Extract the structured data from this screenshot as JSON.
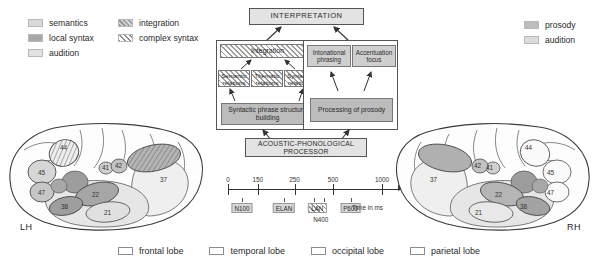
{
  "legend_left": {
    "items": [
      {
        "label": "semantics",
        "swatch": "sw-semantics"
      },
      {
        "label": "local syntax",
        "swatch": "sw-localsyntax"
      },
      {
        "label": "audition",
        "swatch": "sw-audition"
      }
    ]
  },
  "legend_middle": {
    "items": [
      {
        "label": "integration",
        "swatch": "sw-integration"
      },
      {
        "label": "complex syntax",
        "swatch": "sw-complex"
      }
    ]
  },
  "legend_right": {
    "items": [
      {
        "label": "prosody",
        "swatch": "sw-prosody"
      },
      {
        "label": "audition",
        "swatch": "sw-audition2"
      }
    ]
  },
  "legend_lobes": {
    "items": [
      {
        "label": "frontal lobe"
      },
      {
        "label": "temporal lobe"
      },
      {
        "label": "occipital lobe"
      },
      {
        "label": "parietal lobe"
      }
    ]
  },
  "flowchart": {
    "interpretation": "INTERPRETATION",
    "acoustic_processor": "ACOUSTIC-PHONOLOGICAL PROCESSOR",
    "syntax_panel": {
      "integration": "Integration",
      "semantic_relations": "Semantic relations",
      "thematic_relations": "Thematic relations",
      "syntactic_relations": "Syntactic relations",
      "phrase_structure": "Syntactic phrase structure building"
    },
    "prosody_panel": {
      "intonational_phrasing": "Intonational phrasing",
      "accentuation_focus": "Accentuation focus",
      "processing_of_prosody": "Processing of prosody"
    }
  },
  "timeline": {
    "unit_label": "Time in ms",
    "ticks": [
      {
        "value": 0,
        "label": "0",
        "pos_pct": 0
      },
      {
        "value": 150,
        "label": "150",
        "pos_pct": 17
      },
      {
        "value": 250,
        "label": "250",
        "pos_pct": 38
      },
      {
        "value": 500,
        "label": "500",
        "pos_pct": 60
      },
      {
        "value": 1000,
        "label": "1000",
        "pos_pct": 88
      }
    ],
    "components": [
      {
        "label": "N100",
        "pos_pct": 8,
        "style": "solid"
      },
      {
        "label": "ELAN",
        "pos_pct": 32,
        "style": "solid"
      },
      {
        "label": "LAN",
        "pos_pct": 51,
        "style": "hatch"
      },
      {
        "label": "N400",
        "pos_pct": 53,
        "style": "plain"
      },
      {
        "label": "P600",
        "pos_pct": 70,
        "style": "solid"
      }
    ]
  },
  "brains": {
    "left": {
      "hemisphere_label": "LH",
      "areas": [
        "44",
        "45",
        "47",
        "41",
        "42",
        "22",
        "38",
        "21",
        "37"
      ]
    },
    "right": {
      "hemisphere_label": "RH",
      "areas": [
        "44",
        "45",
        "47",
        "41",
        "42",
        "22",
        "38",
        "21",
        "37"
      ]
    }
  },
  "colors": {
    "semantics": "#d9d9d9",
    "local_syntax": "#a8a8a8",
    "audition": "#e2e2e2",
    "prosody": "#bdbdbd",
    "box_fill": "#e3e3e3",
    "cell_fill": "#bcbcbc",
    "outline": "#555555"
  }
}
